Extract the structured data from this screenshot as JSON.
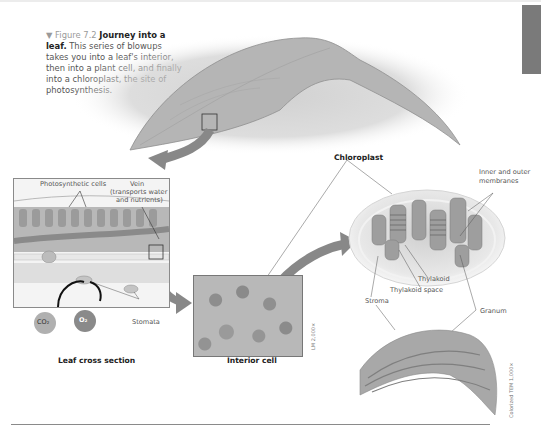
{
  "figure": {
    "number_label": "▼ Figure 7.2",
    "title_bold": "Journey into a leaf.",
    "caption": "This series of blowups takes you into a leaf's interior, then into a plant cell, and finally into a chloroplast, the site of photosynthesis."
  },
  "panels": {
    "leaf_cross_section": {
      "title": "Leaf cross section",
      "labels": {
        "photosynthetic_cells": "Photosynthetic cells",
        "vein": "Vein",
        "vein_note_1": "(transports water",
        "vein_note_2": "and nutrients)",
        "stomata": "Stomata",
        "co2": "CO₂",
        "o2": "O₂"
      }
    },
    "interior_cell": {
      "title": "Interior cell",
      "scale": "LM 2,000×"
    },
    "chloroplast": {
      "title": "Chloroplast",
      "labels": {
        "membranes_1": "Inner and outer",
        "membranes_2": "membranes",
        "thylakoid": "Thylakoid",
        "thylakoid_space": "Thylakoid space",
        "stroma": "Stroma",
        "granum": "Granum"
      },
      "scale": "Colorized TEM 1,000×"
    }
  },
  "colors": {
    "co2": "#b0b0b0",
    "o2": "#8a8a8a",
    "arrow": "#888888",
    "sidetab": "#7a7a7a"
  }
}
